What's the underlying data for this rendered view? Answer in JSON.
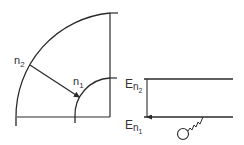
{
  "colors": {
    "stroke": "#2a2a2a",
    "text": "#333333",
    "background": "#ffffff"
  },
  "left_diagram": {
    "outer_arc_label": {
      "base": "n",
      "sub": "2"
    },
    "inner_arc_label": {
      "base": "n",
      "sub": "1"
    }
  },
  "right_diagram": {
    "upper_level_label": {
      "base": "E",
      "sub": "n",
      "subsub": "2"
    },
    "lower_level_label": {
      "base": "E",
      "sub": "n",
      "subsub": "1"
    },
    "electron": "electron-with-zigzag"
  }
}
